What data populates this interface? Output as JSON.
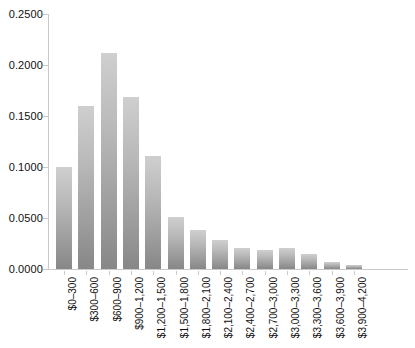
{
  "chart_data": {
    "type": "bar",
    "title": "",
    "subtitle": "",
    "xlabel": "",
    "ylabel": "",
    "grid": false,
    "legend": null,
    "orientation": "vertical",
    "xtick_rotation": -90,
    "ylim": [
      0.0,
      0.25
    ],
    "ytick_labels": [
      "0.2500",
      "0.2000",
      "0.1500",
      "0.1000",
      "0.0500",
      "0.0000"
    ],
    "ytick_values": [
      0.25,
      0.2,
      0.15,
      0.1,
      0.05,
      0.0
    ],
    "categories": [
      "$0–300",
      "$300–600",
      "$600–900",
      "$900–1,200",
      "$1,200–1,500",
      "$1,500–1,800",
      "$1,800–2,100",
      "$2,100–2,400",
      "$2,400–2,700",
      "$2,700–3,000",
      "$3,000–3,300",
      "$3,300–3,600",
      "$3,600–3,900",
      "$3,900–4,200"
    ],
    "values": [
      0.1,
      0.16,
      0.212,
      0.169,
      0.111,
      0.051,
      0.038,
      0.028,
      0.021,
      0.019,
      0.021,
      0.015,
      0.007,
      0.004
    ],
    "bar_color_top": "#cfcfcf",
    "bar_color_bottom": "#878787",
    "axis_color": "#c9c9c9",
    "background": "#ffffff"
  }
}
